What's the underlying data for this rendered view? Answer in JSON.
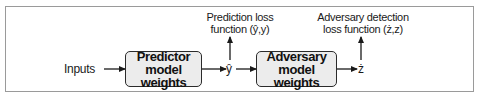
{
  "diagram": {
    "type": "flowchart",
    "inputs_label": "Inputs",
    "nodes": [
      {
        "id": "predictor",
        "line1": "Predictor",
        "line2": "model weights"
      },
      {
        "id": "adversary",
        "line1": "Adversary",
        "line2": "model weights"
      }
    ],
    "outputs": {
      "y_hat": "ŷ",
      "z_hat": "ż"
    },
    "loss_labels": {
      "prediction": {
        "line1": "Prediction loss",
        "line2": "function (ŷ,y)"
      },
      "adversary": {
        "line1": "Adversary detection",
        "line2": "loss function (ż,z)"
      }
    },
    "edges": [
      {
        "from": "Inputs",
        "to": "Predictor model weights"
      },
      {
        "from": "Predictor model weights",
        "to": "ŷ"
      },
      {
        "from": "ŷ",
        "to": "Prediction loss function (ŷ,y)"
      },
      {
        "from": "ŷ",
        "to": "Adversary model weights"
      },
      {
        "from": "Adversary model weights",
        "to": "ż"
      },
      {
        "from": "ż",
        "to": "Adversary detection loss function (ż,z)"
      }
    ],
    "colors": {
      "box_fill": "#ececec",
      "box_border": "#2b2b2b",
      "frame_border": "#9a9a9a",
      "arrow": "#1a1a1a"
    }
  }
}
